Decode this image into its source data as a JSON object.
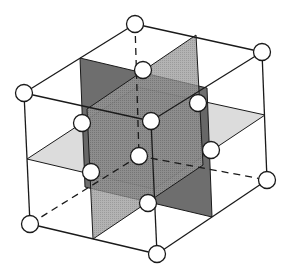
{
  "diagram": {
    "colors": {
      "background": "#ffffff",
      "line": "#1a1a1a",
      "atom_fill": "#ffffff",
      "plane_dark": "#4a4a4a",
      "plane_hatched": "#8c8c8c",
      "plane_light": "#d6d6d6"
    },
    "atom_radius": 8.5,
    "atoms": [
      {
        "id": "corner-top-back",
        "x": 135,
        "y": 24
      },
      {
        "id": "corner-top-right",
        "x": 262,
        "y": 52
      },
      {
        "id": "corner-top-left",
        "x": 24,
        "y": 93
      },
      {
        "id": "corner-top-front",
        "x": 151,
        "y": 121
      },
      {
        "id": "corner-bottom-back",
        "x": 139,
        "y": 156
      },
      {
        "id": "corner-bottom-right",
        "x": 267,
        "y": 180
      },
      {
        "id": "corner-bottom-left",
        "x": 30,
        "y": 224
      },
      {
        "id": "corner-bottom-front",
        "x": 157,
        "y": 254
      },
      {
        "id": "face-top",
        "x": 143,
        "y": 70
      },
      {
        "id": "face-back-left",
        "x": 82,
        "y": 123
      },
      {
        "id": "face-back-right",
        "x": 198,
        "y": 103
      },
      {
        "id": "face-front-left",
        "x": 91,
        "y": 172
      },
      {
        "id": "face-front-right",
        "x": 211,
        "y": 150
      },
      {
        "id": "face-bottom",
        "x": 148,
        "y": 203
      }
    ],
    "planes": [
      {
        "id": "horizontal-mid-plane",
        "shade": "light",
        "points": [
          [
            137,
            87
          ],
          [
            27,
            159
          ],
          [
            154,
            189
          ],
          [
            265,
            115
          ]
        ]
      },
      {
        "id": "vertical-plane-a",
        "shade": "dark",
        "points": [
          [
            80,
            58
          ],
          [
            207,
            88
          ],
          [
            212,
            217
          ],
          [
            85,
            187
          ]
        ]
      },
      {
        "id": "vertical-plane-b",
        "shade": "hatched",
        "points": [
          [
            196,
            35
          ],
          [
            87,
            109
          ],
          [
            93,
            239
          ],
          [
            203,
            165
          ]
        ]
      }
    ],
    "solid_edges": [
      [
        [
          24,
          93
        ],
        [
          135,
          24
        ]
      ],
      [
        [
          135,
          24
        ],
        [
          262,
          52
        ]
      ],
      [
        [
          262,
          52
        ],
        [
          151,
          121
        ]
      ],
      [
        [
          151,
          121
        ],
        [
          24,
          93
        ]
      ],
      [
        [
          24,
          93
        ],
        [
          30,
          224
        ]
      ],
      [
        [
          30,
          224
        ],
        [
          157,
          254
        ]
      ],
      [
        [
          157,
          254
        ],
        [
          267,
          180
        ]
      ],
      [
        [
          267,
          180
        ],
        [
          262,
          52
        ]
      ],
      [
        [
          151,
          121
        ],
        [
          157,
          254
        ]
      ]
    ],
    "dashed_edges": [
      [
        [
          135,
          24
        ],
        [
          139,
          156
        ]
      ],
      [
        [
          139,
          156
        ],
        [
          30,
          224
        ]
      ],
      [
        [
          139,
          156
        ],
        [
          267,
          180
        ]
      ]
    ]
  }
}
